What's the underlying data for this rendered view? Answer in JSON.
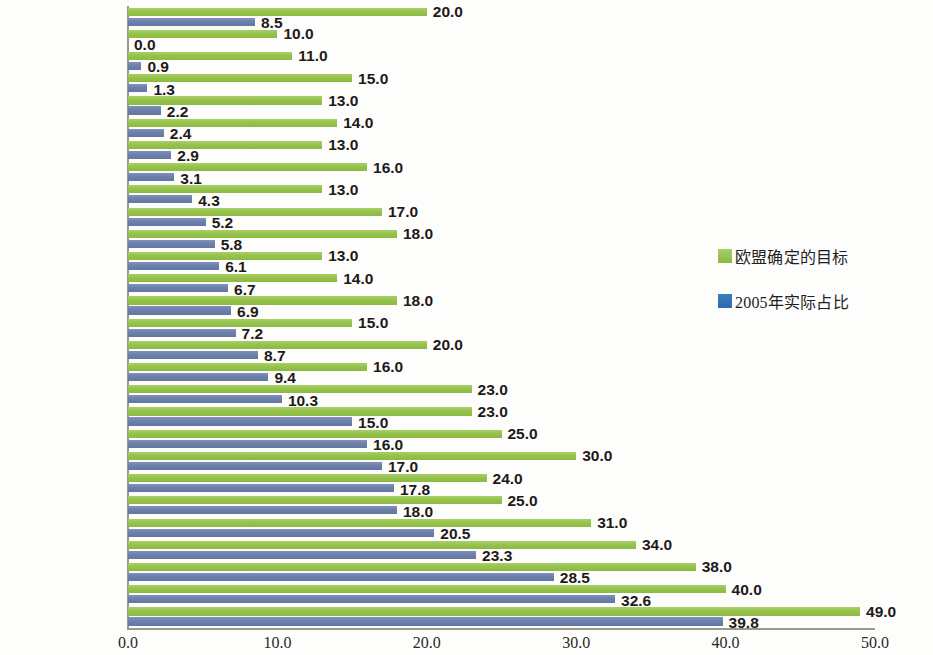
{
  "chart_data": {
    "type": "bar",
    "orientation": "horizontal",
    "title": "",
    "subtitle": "",
    "xlabel": "",
    "ylabel": "",
    "xlim": [
      0.0,
      50.0
    ],
    "xticks": [
      "0.0",
      "10.0",
      "20.0",
      "30.0",
      "40.0",
      "50.0"
    ],
    "xtick_values": [
      0,
      10,
      20,
      30,
      40,
      50
    ],
    "grid": false,
    "legend_position": "right",
    "categories": [
      "欧盟27国总计",
      "马尔他",
      "卢森堡",
      "英国",
      "比利时",
      "荷兰",
      "塞浦路斯",
      "爱尔兰",
      "匈牙利",
      "意大利",
      "德国",
      "捷克",
      "斯洛伐克",
      "希腊",
      "波兰",
      "西班牙",
      "保加利亚",
      "法国",
      "立陶宛",
      "斯洛文尼亚",
      "丹麦",
      "罗马利亚",
      "爱沙尼亚",
      "葡萄牙",
      "奥地利",
      "芬兰",
      "拉脱维亚",
      "瑞典"
    ],
    "series": [
      {
        "name": "欧盟确定的目标",
        "color": "#8bb943",
        "values": [
          20.0,
          10.0,
          11.0,
          15.0,
          13.0,
          14.0,
          13.0,
          16.0,
          13.0,
          17.0,
          18.0,
          13.0,
          14.0,
          18.0,
          15.0,
          20.0,
          16.0,
          23.0,
          23.0,
          25.0,
          30.0,
          24.0,
          25.0,
          31.0,
          34.0,
          38.0,
          40.0,
          49.0
        ],
        "labels": [
          "20.0",
          "10.0",
          "11.0",
          "15.0",
          "13.0",
          "14.0",
          "13.0",
          "16.0",
          "13.0",
          "17.0",
          "18.0",
          "13.0",
          "14.0",
          "18.0",
          "15.0",
          "20.0",
          "16.0",
          "23.0",
          "23.0",
          "25.0",
          "30.0",
          "24.0",
          "25.0",
          "31.0",
          "34.0",
          "38.0",
          "40.0",
          "49.0"
        ]
      },
      {
        "name": "2005年实际占比",
        "color": "#63779f",
        "values": [
          8.5,
          0.0,
          0.9,
          1.3,
          2.2,
          2.4,
          2.9,
          3.1,
          4.3,
          5.2,
          5.8,
          6.1,
          6.7,
          6.9,
          7.2,
          8.7,
          9.4,
          10.3,
          15.0,
          16.0,
          17.0,
          17.8,
          18.0,
          20.5,
          23.3,
          28.5,
          32.6,
          39.8
        ],
        "labels": [
          "8.5",
          "0.0",
          "0.9",
          "1.3",
          "2.2",
          "2.4",
          "2.9",
          "3.1",
          "4.3",
          "5.2",
          "5.8",
          "6.1",
          "6.7",
          "6.9",
          "7.2",
          "8.7",
          "9.4",
          "10.3",
          "15.0",
          "16.0",
          "17.0",
          "17.8",
          "18.0",
          "20.5",
          "23.3",
          "28.5",
          "32.6",
          "39.8"
        ]
      }
    ]
  },
  "legend": {
    "items": [
      {
        "label": "欧盟确定的目标",
        "color": "#8bb943"
      },
      {
        "label": "2005年实际占比",
        "color": "#3a7cc0"
      }
    ]
  }
}
